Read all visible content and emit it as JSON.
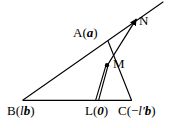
{
  "figure": {
    "width": 186,
    "height": 128,
    "background": "#ffffff",
    "stroke_color": "#000000"
  },
  "labels": {
    "A": {
      "point": "A",
      "open": "(",
      "vector": "a",
      "close": ")"
    },
    "N": {
      "point": "N"
    },
    "M": {
      "point": "M"
    },
    "B": {
      "point": "B",
      "open": "(",
      "scalar": "l",
      "vector": "b",
      "close": ")"
    },
    "L": {
      "point": "L",
      "open": "(",
      "vector": "0",
      "close": ")"
    },
    "C": {
      "point": "C",
      "open": "(",
      "minus": "−",
      "scalar": "l′",
      "vector": "b",
      "close": ")"
    }
  },
  "points": {
    "B": {
      "x": 23,
      "y": 100
    },
    "L": {
      "x": 97,
      "y": 100
    },
    "C": {
      "x": 131,
      "y": 100
    },
    "A": {
      "x": 108,
      "y": 41
    },
    "M": {
      "x": 107,
      "y": 65
    },
    "N": {
      "x": 137,
      "y": 18
    }
  },
  "segments": [
    {
      "name": "ray-B-through-A-to-upper-right",
      "from": "B",
      "to_x": 163,
      "to_y": 2
    },
    {
      "name": "baseline-B-to-C",
      "from": "B",
      "to": "C"
    },
    {
      "name": "line-A-to-C",
      "from": "A",
      "to": "C"
    },
    {
      "name": "ray-L-to-N",
      "from": "L",
      "to": "N"
    }
  ]
}
